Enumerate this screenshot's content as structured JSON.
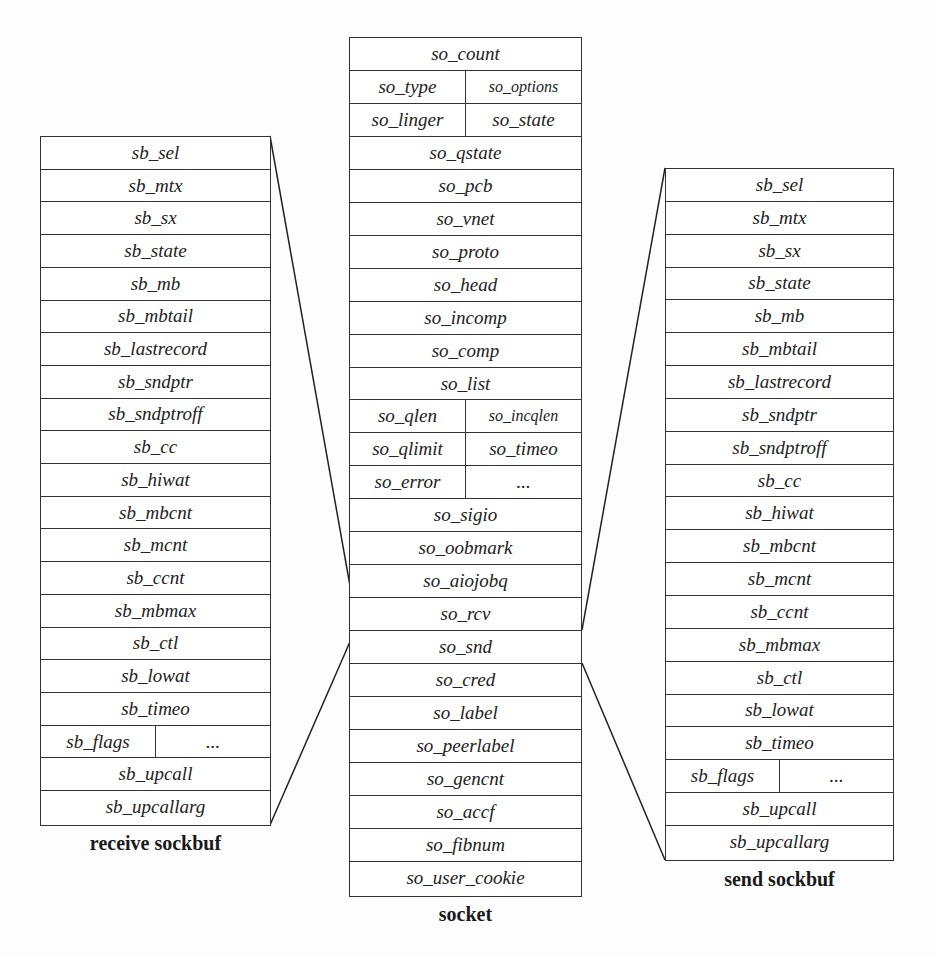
{
  "diagram": {
    "receive_sockbuf": {
      "caption": "receive sockbuf",
      "rows": [
        [
          "sb_sel"
        ],
        [
          "sb_mtx"
        ],
        [
          "sb_sx"
        ],
        [
          "sb_state"
        ],
        [
          "sb_mb"
        ],
        [
          "sb_mbtail"
        ],
        [
          "sb_lastrecord"
        ],
        [
          "sb_sndptr"
        ],
        [
          "sb_sndptroff"
        ],
        [
          "sb_cc"
        ],
        [
          "sb_hiwat"
        ],
        [
          "sb_mbcnt"
        ],
        [
          "sb_mcnt"
        ],
        [
          "sb_ccnt"
        ],
        [
          "sb_mbmax"
        ],
        [
          "sb_ctl"
        ],
        [
          "sb_lowat"
        ],
        [
          "sb_timeo"
        ],
        [
          "sb_flags",
          "..."
        ],
        [
          "sb_upcall"
        ],
        [
          "sb_upcallarg"
        ]
      ]
    },
    "socket": {
      "caption": "socket",
      "rows": [
        [
          "so_count"
        ],
        [
          "so_type",
          "so_options"
        ],
        [
          "so_linger",
          "so_state"
        ],
        [
          "so_qstate"
        ],
        [
          "so_pcb"
        ],
        [
          "so_vnet"
        ],
        [
          "so_proto"
        ],
        [
          "so_head"
        ],
        [
          "so_incomp"
        ],
        [
          "so_comp"
        ],
        [
          "so_list"
        ],
        [
          "so_qlen",
          "so_incqlen"
        ],
        [
          "so_qlimit",
          "so_timeo"
        ],
        [
          "so_error",
          "..."
        ],
        [
          "so_sigio"
        ],
        [
          "so_oobmark"
        ],
        [
          "so_aiojobq"
        ],
        [
          "so_rcv"
        ],
        [
          "so_snd"
        ],
        [
          "so_cred"
        ],
        [
          "so_label"
        ],
        [
          "so_peerlabel"
        ],
        [
          "so_gencnt"
        ],
        [
          "so_accf"
        ],
        [
          "so_fibnum"
        ],
        [
          "so_user_cookie"
        ]
      ]
    },
    "send_sockbuf": {
      "caption": "send sockbuf",
      "rows": [
        [
          "sb_sel"
        ],
        [
          "sb_mtx"
        ],
        [
          "sb_sx"
        ],
        [
          "sb_state"
        ],
        [
          "sb_mb"
        ],
        [
          "sb_mbtail"
        ],
        [
          "sb_lastrecord"
        ],
        [
          "sb_sndptr"
        ],
        [
          "sb_sndptroff"
        ],
        [
          "sb_cc"
        ],
        [
          "sb_hiwat"
        ],
        [
          "sb_mbcnt"
        ],
        [
          "sb_mcnt"
        ],
        [
          "sb_ccnt"
        ],
        [
          "sb_mbmax"
        ],
        [
          "sb_ctl"
        ],
        [
          "sb_lowat"
        ],
        [
          "sb_timeo"
        ],
        [
          "sb_flags",
          "..."
        ],
        [
          "sb_upcall"
        ],
        [
          "sb_upcallarg"
        ]
      ]
    },
    "connections": [
      {
        "from": "socket.so_rcv",
        "to": "receive_sockbuf"
      },
      {
        "from": "socket.so_snd",
        "to": "send_sockbuf"
      }
    ]
  }
}
